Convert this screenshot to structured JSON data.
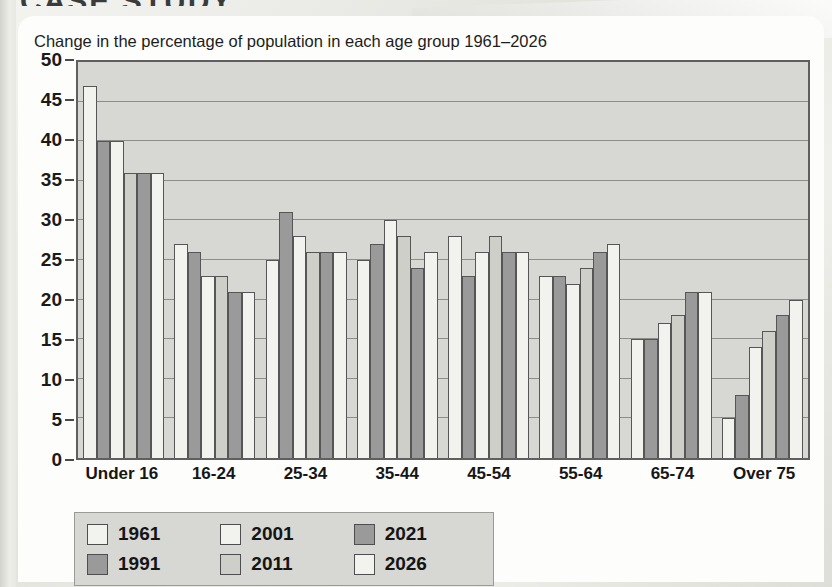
{
  "page": {
    "cropped_heading": "CASE STUDY"
  },
  "chart_title": "Change in the percentage of population in each age group 1961–2026",
  "colors": {
    "plot_background": "#d7d7d3",
    "plot_border": "#5f5f5f",
    "gridline": "#8d8d8a",
    "bar_light": "#f2f2ef",
    "bar_pale": "#e2e2de",
    "bar_mid": "#cfcfca",
    "bar_dark": "#9a9a9a",
    "bar_outline": "#565656",
    "legend_background": "#d7d7d3",
    "text": "#161616"
  },
  "chart_data": {
    "type": "bar",
    "title": "Change in the percentage of population in each age group 1961–2026",
    "xlabel": "",
    "ylabel": "",
    "ylim": [
      0,
      50
    ],
    "yticks": [
      0,
      5,
      10,
      15,
      20,
      25,
      30,
      35,
      40,
      45,
      50
    ],
    "grid": true,
    "legend_position": "below-left",
    "categories": [
      "Under 16",
      "16-24",
      "25-34",
      "35-44",
      "45-54",
      "55-64",
      "65-74",
      "Over 75"
    ],
    "series": [
      {
        "name": "1961",
        "color": "#f2f2ef",
        "values": [
          47,
          27,
          25,
          25,
          28,
          23,
          15,
          5
        ]
      },
      {
        "name": "1991",
        "color": "#9a9a9a",
        "values": [
          40,
          26,
          31,
          27,
          23,
          23,
          15,
          8
        ]
      },
      {
        "name": "2001",
        "color": "#f2f2ef",
        "values": [
          40,
          23,
          28,
          30,
          26,
          22,
          17,
          14
        ]
      },
      {
        "name": "2011",
        "color": "#cfcfca",
        "values": [
          36,
          23,
          26,
          28,
          28,
          24,
          18,
          16
        ]
      },
      {
        "name": "2021",
        "color": "#9a9a9a",
        "values": [
          36,
          21,
          26,
          24,
          26,
          26,
          21,
          18
        ]
      },
      {
        "name": "2026",
        "color": "#f2f2ef",
        "values": [
          36,
          21,
          26,
          26,
          26,
          27,
          21,
          20
        ]
      }
    ]
  },
  "legend": {
    "items": [
      {
        "label": "1961",
        "color": "#f2f2ef"
      },
      {
        "label": "1991",
        "color": "#9a9a9a"
      },
      {
        "label": "2001",
        "color": "#f2f2ef"
      },
      {
        "label": "2011",
        "color": "#cfcfca"
      },
      {
        "label": "2021",
        "color": "#9a9a9a"
      },
      {
        "label": "2026",
        "color": "#f2f2ef"
      }
    ]
  }
}
